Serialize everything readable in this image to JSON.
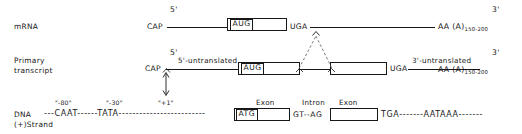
{
  "rows": {
    "mrna": {
      "label": "mRNA",
      "five_prime": "5'",
      "three_prime": "3'",
      "cap": "CAP",
      "start_codon": "AUG",
      "stop_codon": "UGA",
      "polya": "AA (A)",
      "polya_sub": "150-200"
    },
    "primary": {
      "label_line1": "Primary",
      "label_line2": "transcript",
      "five_prime": "5'",
      "three_prime": "3'",
      "cap": "CAP",
      "five_utr": "5'-untranslated",
      "three_utr": "3'-untranslated",
      "start_codon": "AUG",
      "stop_codon": "UGA",
      "polya": "AA (A)",
      "polya_sub": "150-200"
    },
    "dna": {
      "label_line1": "DNA",
      "label_line2": "(+)Strand",
      "tick_minus80": "\"-80\"",
      "tick_minus30": "\"-30\"",
      "tick_plus1": "\"+1\"",
      "lead_dashes": "---",
      "caat_box": "CAAT",
      "caat_trailing": "------",
      "tata_box": "TATA",
      "tata_trailing": "-------------------------",
      "start_codon": "ATG",
      "exon_label_1": "Exon",
      "intron_label": "Intron",
      "exon_label_2": "Exon",
      "splice_donor": "GT",
      "splice_dashes": "--",
      "splice_acceptor": "AG",
      "stop_codon": "TGA",
      "stop_trailing": "-------",
      "polya_signal": "AATAAA",
      "tail_dashes": "-------"
    }
  },
  "colors": {
    "ink": "#171717",
    "background": "#ffffff",
    "splice_dash": "#6b6b6b"
  }
}
